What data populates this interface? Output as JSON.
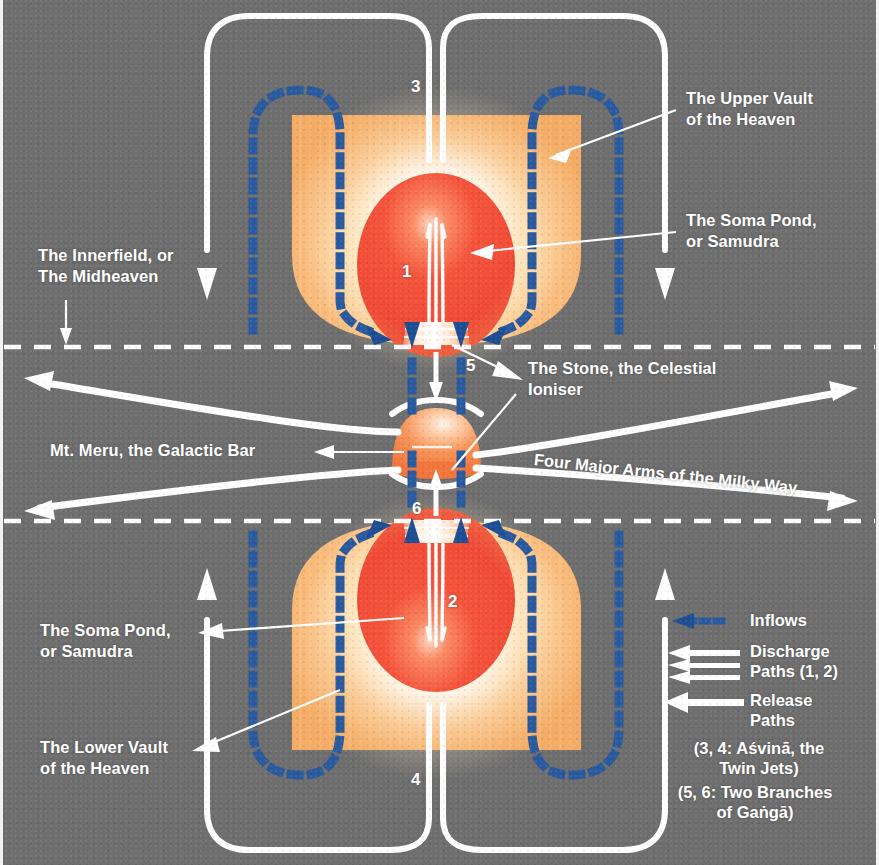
{
  "diagram": {
    "background_color": "#6e6e6e",
    "accent_white": "#ffffff",
    "inflow_blue": "#2a5a9e",
    "vault_orange": "#f7b172",
    "pond_red": "#f04a36",
    "meru_orange": "#f58b4c"
  },
  "labels": {
    "upper_vault": "The Upper Vault\nof the Heaven",
    "upper_soma": "The Soma Pond,\nor Samudra",
    "innerfield": "The Innerfield, or\nThe Midheaven",
    "stone": "The Stone, the Celestial\nIoniser",
    "meru": "Mt. Meru, the Galactic Bar",
    "arms": "Four Major Arms of the Milky Way",
    "lower_soma": "The Soma Pond,\nor Samudra",
    "lower_vault": "The Lower Vault\nof the Heaven"
  },
  "numbers": {
    "n1": "1",
    "n2": "2",
    "n3": "3",
    "n4": "4",
    "n5": "5",
    "n6": "6"
  },
  "legend": {
    "inflows": "Inflows",
    "discharge": "Discharge\nPaths (1, 2)",
    "release": "Release\nPaths",
    "note_asvina": "(3, 4: Aśvinā, the\nTwin Jets)",
    "note_ganga": "(5, 6: Two Branches\nof Gaṅgā)"
  }
}
